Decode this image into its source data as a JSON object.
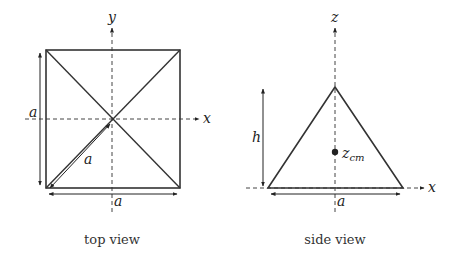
{
  "top_view": {
    "caption": "top view",
    "axis_x_label": "x",
    "axis_y_label": "y",
    "side_label_left": "a",
    "side_label_bottom": "a",
    "diagonal_label": "a"
  },
  "side_view": {
    "caption": "side view",
    "axis_x_label": "x",
    "axis_z_label": "z",
    "height_label": "h",
    "base_label": "a",
    "cm_label_main": "z",
    "cm_label_sub": "cm"
  },
  "colors": {
    "line": "#333333",
    "axis": "#444444"
  }
}
